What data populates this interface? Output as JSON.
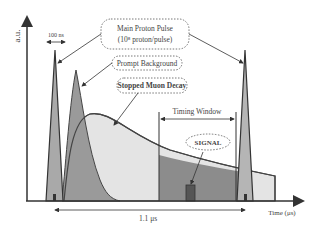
{
  "diagram": {
    "y_axis_label": "a.u.",
    "x_axis_label": "Time (μs)",
    "pulse_width_label": "100 ns",
    "period_label": "1.1 μs",
    "labels": {
      "main_pulse_line1": "Main Proton Pulse",
      "main_pulse_line2": "(10⁸ proton/pulse)",
      "prompt_background": "Prompt Background",
      "stopped_muon_decay": "Stopped Muon Decay",
      "timing_window": "Timing Window",
      "signal": "SIGNAL"
    },
    "colors": {
      "axis": "#3a3a3a",
      "pulse_fill": "#a9a9a9",
      "prompt_fill": "#9a9a9a",
      "decay_fill_light": "#e4e4e4",
      "decay_fill_dark": "#8c8c8c",
      "signal_fill": "#555555",
      "label_text": "#444444"
    }
  }
}
